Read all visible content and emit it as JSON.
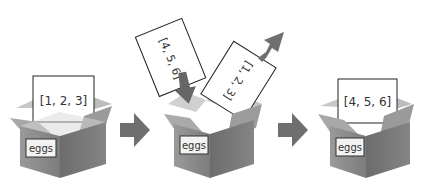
{
  "diagram": {
    "colors": {
      "box": "#8a8a8a",
      "box_dark": "#6e6e6e",
      "box_light": "#b8b8b8",
      "arrow": "#6f6f6f",
      "paper": "#ffffff",
      "outline": "#222222"
    },
    "steps": [
      {
        "box_label": "eggs",
        "paper": "[1, 2, 3]"
      },
      {
        "box_label": "eggs",
        "paper_in": "[4, 5, 6]",
        "paper_out": "[1, 2, 3]"
      },
      {
        "box_label": "eggs",
        "paper": "[4, 5, 6]"
      }
    ]
  }
}
